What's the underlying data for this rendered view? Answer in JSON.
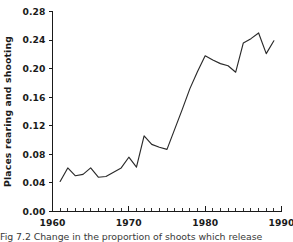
{
  "figure": {
    "caption": "Fig 7.2 Change in the proportion of shoots which release"
  },
  "chart_data": {
    "type": "line",
    "title": "",
    "xlabel": "",
    "ylabel": "Places rearing and shooting",
    "xlim": [
      1960,
      1990
    ],
    "ylim": [
      0.0,
      0.28
    ],
    "grid": false,
    "legend": null,
    "x_ticks": [
      1960,
      1970,
      1980,
      1990
    ],
    "x_tick_labels": [
      "1960",
      "1970",
      "1980",
      "1990"
    ],
    "x_minor_tick_step": 1,
    "y_ticks": [
      0.0,
      0.04,
      0.08,
      0.12,
      0.16,
      0.2,
      0.24,
      0.28
    ],
    "y_tick_labels": [
      "0.00",
      "0.04",
      "0.08",
      "0.12",
      "0.16",
      "0.20",
      "0.24",
      "0.28"
    ],
    "line_color": "#2a2a2a",
    "x": [
      1961,
      1962,
      1963,
      1964,
      1965,
      1966,
      1967,
      1968,
      1969,
      1970,
      1971,
      1972,
      1973,
      1974,
      1975,
      1976,
      1977,
      1978,
      1979,
      1980,
      1981,
      1982,
      1983,
      1984,
      1985,
      1986,
      1987,
      1988,
      1989
    ],
    "values": [
      0.042,
      0.061,
      0.05,
      0.052,
      0.061,
      0.048,
      0.049,
      0.055,
      0.061,
      0.076,
      0.062,
      0.106,
      0.094,
      0.09,
      0.087,
      0.115,
      0.143,
      0.172,
      0.196,
      0.218,
      0.212,
      0.207,
      0.204,
      0.195,
      0.236,
      0.242,
      0.25,
      0.221,
      0.239
    ],
    "series": [
      {
        "name": "Places rearing and shooting",
        "values": [
          0.042,
          0.061,
          0.05,
          0.052,
          0.061,
          0.048,
          0.049,
          0.055,
          0.061,
          0.076,
          0.062,
          0.106,
          0.094,
          0.09,
          0.087,
          0.115,
          0.143,
          0.172,
          0.196,
          0.218,
          0.212,
          0.207,
          0.204,
          0.195,
          0.236,
          0.242,
          0.25,
          0.221,
          0.239
        ]
      }
    ]
  }
}
